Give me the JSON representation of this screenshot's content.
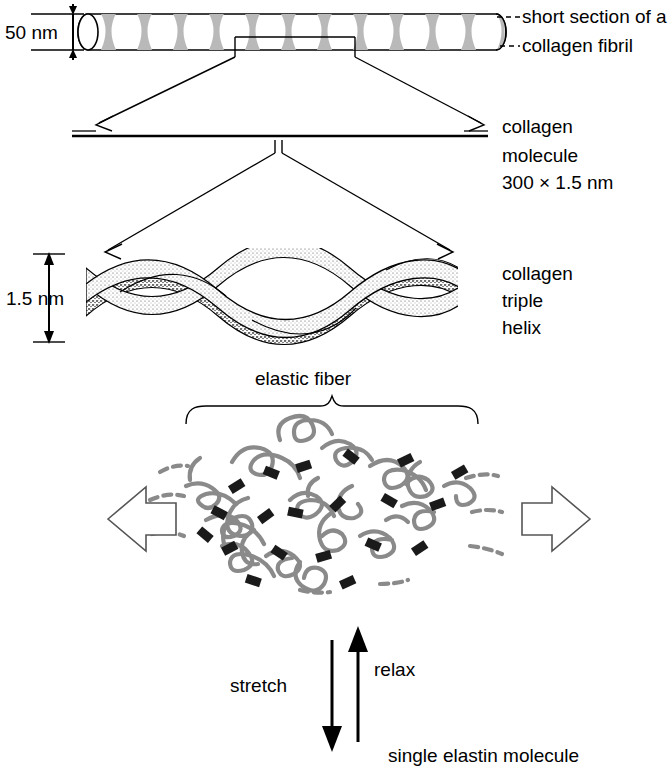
{
  "figure": {
    "collagen_section": {
      "fibril_diameter_label": "50 nm",
      "fibril_label_line1": "short section of a",
      "fibril_label_line2": "collagen fibril",
      "molecule_label_line1": "collagen",
      "molecule_label_line2": "molecule",
      "molecule_label_line3": "300 × 1.5 nm",
      "helix_width_label": "1.5 nm",
      "helix_label_line1": "collagen",
      "helix_label_line2": "triple",
      "helix_label_line3": "helix"
    },
    "elastin_section": {
      "fiber_label": "elastic fiber",
      "stretch_label": "stretch",
      "relax_label": "relax",
      "molecule_label": "single elastin molecule"
    },
    "colors": {
      "ink": "#000000",
      "band_gray": "#b9b9b9",
      "coil_gray": "#8a8a8a",
      "crosslink_black": "#1a1a1a",
      "background": "#ffffff"
    }
  }
}
